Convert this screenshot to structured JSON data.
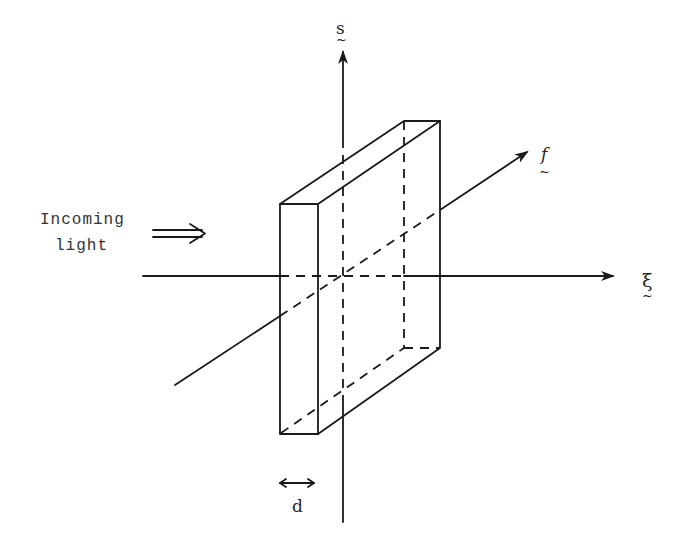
{
  "diagram": {
    "axes": {
      "vertical": {
        "label": "s",
        "tilde": "~"
      },
      "horizontal": {
        "label": "ξ",
        "tilde": "~"
      },
      "diagonal": {
        "label": "f",
        "tilde": "~"
      }
    },
    "incoming_light": {
      "line1": "Incoming",
      "line2": "light",
      "arrow": "⇒"
    },
    "thickness": {
      "label": "d",
      "arrow": "↔"
    },
    "colors": {
      "stroke": "#1a1a1a",
      "background": "#ffffff"
    }
  }
}
